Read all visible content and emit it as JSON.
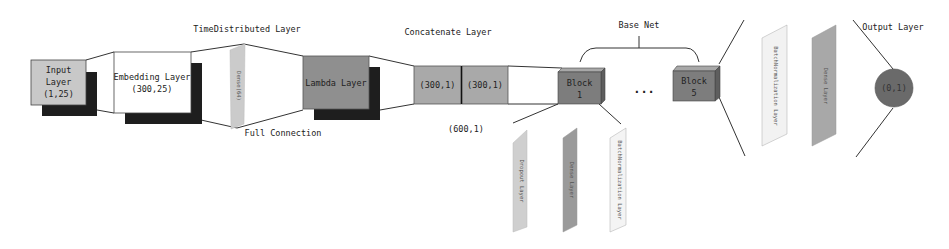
{
  "diagram": {
    "title_labels": {
      "time_distributed": "TimeDistributed Layer",
      "concatenate": "Concatenate Layer",
      "base_net": "Base Net",
      "output_layer": "Output Layer",
      "full_connection": "Full Connection",
      "concat_shape": "(600,1)"
    },
    "nodes": {
      "input": {
        "line1": "Input",
        "line2": "Layer",
        "line3": "(1,25)"
      },
      "embedding": {
        "line1": "Embedding Layer",
        "line2": "(300,25)"
      },
      "time_distributed_slab": {
        "label": "Dense(64)"
      },
      "lambda": {
        "label": "Lambda Layer"
      },
      "concat_left": {
        "label": "(300,1)"
      },
      "concat_right": {
        "label": "(300,1)"
      },
      "block1": {
        "line1": "Block",
        "line2": "1"
      },
      "ellipsis": {
        "label": "..."
      },
      "block5": {
        "line1": "Block",
        "line2": "5"
      },
      "output": {
        "label": "(0,1)"
      }
    },
    "block_detail": [
      {
        "label": "Dropout Layer",
        "fill": "#cfcfcf"
      },
      {
        "label": "Dense Layer",
        "fill": "#9a9a9a"
      },
      {
        "label": "BatchNormalization Layer",
        "fill": "#f4f4f4"
      }
    ],
    "output_detail": [
      {
        "label": "BatchNormalization Layer",
        "fill": "#f2f2f2"
      },
      {
        "label": "Dense Layer",
        "fill": "#a8a8a8"
      }
    ],
    "colors": {
      "input_fill": "#c8c8c8",
      "shadow": "#1e1e1e",
      "lambda_fill": "#8f8f8f",
      "concat_fill": "#a9a9a9",
      "block_fill": "#7d7d7d",
      "block_top": "#a8a8a8",
      "block_side": "#5e5e5e",
      "output_fill": "#6a6a6a",
      "line": "#333333"
    }
  }
}
